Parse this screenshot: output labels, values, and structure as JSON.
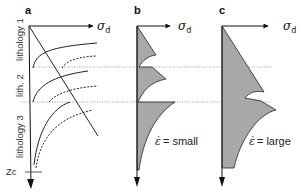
{
  "figure": {
    "panels": [
      {
        "letter": "a",
        "axis_label": "σ",
        "axis_subscript": "d",
        "lithologies": [
          "lithology 1",
          "lith. 2",
          "lithology 3"
        ],
        "depth_marker": "Zc"
      },
      {
        "letter": "b",
        "axis_label": "σ",
        "axis_subscript": "d",
        "strain_rate_symbol": "ε̇",
        "strain_rate_label": "= small"
      },
      {
        "letter": "c",
        "axis_label": "σ",
        "axis_subscript": "d",
        "strain_rate_symbol": "ε̇",
        "strain_rate_label": "= large"
      }
    ],
    "colors": {
      "fill": "#a8a8a8",
      "line": "#222222",
      "dotted_boundary": "#9a9a9a"
    },
    "boundaries_y": [
      67,
      102
    ]
  }
}
